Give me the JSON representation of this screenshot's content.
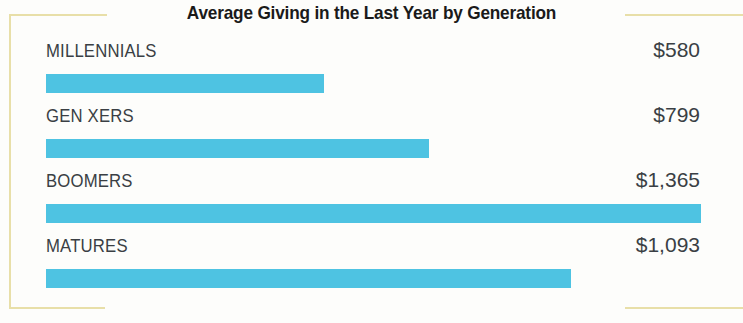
{
  "chart_data": {
    "type": "bar",
    "orientation": "horizontal",
    "title": "Average Giving in the Last Year by Generation",
    "subtitle": "",
    "xlabel": "",
    "ylabel": "",
    "categories": [
      "MILLENNIALS",
      "GEN XERS",
      "BOOMERS",
      "MATURES"
    ],
    "values": [
      580,
      799,
      1365,
      1093
    ],
    "value_labels": [
      "$580",
      "$799",
      "$1,365",
      "$1,093"
    ],
    "xlim": [
      0,
      1365
    ],
    "grid": false,
    "legend": false,
    "bar_color": "#4ec3e2",
    "text_color": "#3a3f44",
    "title_color": "#1a1a1a",
    "frame_color": "#e8dfa8",
    "background_color": "#fdfdfb"
  },
  "rows": [
    {
      "label": "MILLENNIALS",
      "value_label": "$580",
      "value": 580,
      "pct": 42.5
    },
    {
      "label": "GEN XERS",
      "value_label": "$799",
      "value": 799,
      "pct": 58.5
    },
    {
      "label": "BOOMERS",
      "value_label": "$1,365",
      "value": 1365,
      "pct": 100.0
    },
    {
      "label": "MATURES",
      "value_label": "$1,093",
      "value": 1093,
      "pct": 80.1
    }
  ]
}
